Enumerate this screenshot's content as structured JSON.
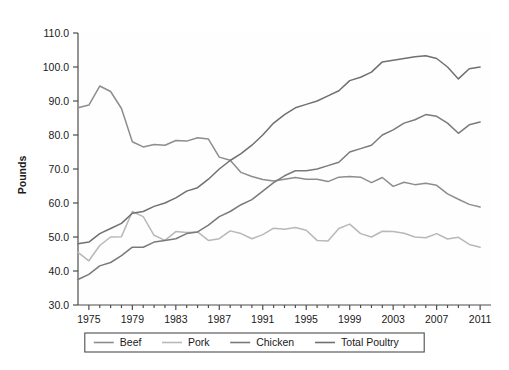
{
  "chart_data": {
    "type": "line",
    "title": "",
    "xlabel": "",
    "ylabel": "Pounds",
    "xlim": [
      1974,
      2012
    ],
    "ylim": [
      30.0,
      110.0
    ],
    "yticks": [
      "110.0",
      "100.0",
      "90.0",
      "80.0",
      "70.0",
      "60.0",
      "50.0",
      "40.0",
      "30.0"
    ],
    "ytick_values": [
      110,
      100,
      90,
      80,
      70,
      60,
      50,
      40,
      30
    ],
    "xticks": [
      "1975",
      "1979",
      "1983",
      "1987",
      "1991",
      "1995",
      "1999",
      "2003",
      "2007",
      "2011"
    ],
    "xtick_values": [
      1975,
      1979,
      1983,
      1987,
      1991,
      1995,
      1999,
      2003,
      2007,
      2011
    ],
    "xtick_minor_step": 1,
    "grid": false,
    "legend_position": "bottom",
    "x": [
      1974,
      1975,
      1976,
      1977,
      1978,
      1979,
      1980,
      1981,
      1982,
      1983,
      1984,
      1985,
      1986,
      1987,
      1988,
      1989,
      1990,
      1991,
      1992,
      1993,
      1994,
      1995,
      1996,
      1997,
      1998,
      1999,
      2000,
      2001,
      2002,
      2003,
      2004,
      2005,
      2006,
      2007,
      2008,
      2009,
      2010,
      2011
    ],
    "series": [
      {
        "name": "Beef",
        "color": "#8d8d8d",
        "values": [
          88.0,
          88.8,
          94.4,
          92.8,
          87.8,
          78.0,
          76.5,
          77.2,
          77.0,
          78.4,
          78.2,
          79.2,
          78.8,
          73.5,
          72.6,
          69.0,
          67.8,
          66.9,
          66.5,
          67.0,
          67.5,
          67.0,
          67.0,
          66.3,
          67.6,
          67.8,
          67.6,
          66.0,
          67.5,
          64.9,
          66.1,
          65.4,
          65.8,
          65.2,
          62.7,
          61.1,
          59.6,
          58.8
        ]
      },
      {
        "name": "Pork",
        "color": "#b8b8b8",
        "values": [
          45.5,
          43.0,
          47.5,
          50.0,
          50.1,
          57.5,
          56.0,
          50.5,
          49.0,
          51.6,
          51.3,
          51.5,
          49.0,
          49.5,
          51.8,
          51.0,
          49.5,
          50.7,
          52.6,
          52.3,
          52.8,
          52.0,
          49.0,
          48.8,
          52.5,
          53.8,
          51.0,
          50.0,
          51.7,
          51.6,
          51.1,
          50.0,
          49.8,
          51.0,
          49.4,
          49.9,
          47.8,
          47.0
        ]
      },
      {
        "name": "Chicken",
        "color": "#7a7a7a",
        "values": [
          37.5,
          39.0,
          41.5,
          42.5,
          44.5,
          47.0,
          47.0,
          48.5,
          49.0,
          49.5,
          51.0,
          51.5,
          53.5,
          56.0,
          57.5,
          59.5,
          61.0,
          63.5,
          66.0,
          68.0,
          69.5,
          69.5,
          70.0,
          71.0,
          72.0,
          75.0,
          76.0,
          77.0,
          80.0,
          81.5,
          83.5,
          84.5,
          86.0,
          85.5,
          83.5,
          80.5,
          83.0,
          83.8
        ]
      },
      {
        "name": "Total Poultry",
        "color": "#707070",
        "values": [
          48.0,
          48.5,
          51.0,
          52.5,
          54.0,
          57.0,
          57.5,
          59.0,
          60.0,
          61.5,
          63.5,
          64.5,
          67.0,
          70.0,
          72.5,
          74.5,
          77.0,
          80.0,
          83.5,
          86.0,
          88.0,
          89.0,
          90.0,
          91.5,
          93.0,
          96.0,
          97.0,
          98.5,
          101.5,
          102.0,
          102.5,
          103.0,
          103.3,
          102.5,
          100.0,
          96.5,
          99.5,
          100.0
        ]
      }
    ]
  },
  "legend": {
    "items": [
      {
        "label": "Beef"
      },
      {
        "label": "Pork"
      },
      {
        "label": "Chicken"
      },
      {
        "label": "Total Poultry"
      }
    ]
  },
  "axes": {
    "y_title": "Pounds"
  },
  "colors": {
    "plot_background": "#fefefe",
    "axis": "#4d4d4d",
    "text": "#1a1a1a",
    "legend_border": "#4d4d4d"
  }
}
